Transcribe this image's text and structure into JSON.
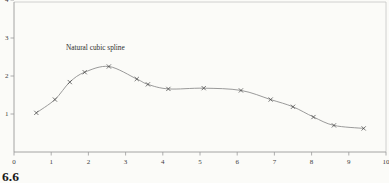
{
  "figure": {
    "number": "6.6"
  },
  "chart_data": {
    "type": "line",
    "title": "",
    "xlabel": "",
    "ylabel": "",
    "annotation": {
      "text": "Natural cubic spline",
      "x": 1.4,
      "y": 2.78
    },
    "x": [
      0.6,
      1.1,
      1.5,
      1.9,
      2.55,
      3.3,
      3.6,
      4.15,
      5.1,
      6.1,
      6.9,
      7.5,
      8.05,
      8.6,
      9.4
    ],
    "y": [
      1.03,
      1.38,
      1.84,
      2.1,
      2.25,
      1.92,
      1.78,
      1.66,
      1.68,
      1.62,
      1.38,
      1.19,
      0.92,
      0.7,
      0.62
    ],
    "xticks": [
      0,
      1,
      2,
      3,
      4,
      5,
      6,
      7,
      8,
      9,
      10
    ],
    "yticks": [
      1,
      2,
      3,
      4
    ],
    "xlim": [
      0,
      10
    ],
    "ylim": [
      0,
      4
    ],
    "marker": "x",
    "grid": false,
    "legend": "none",
    "colors": {
      "curve": "#8e8e8e",
      "marker": "#474747",
      "axis": "#9a9a9a",
      "frame": "#c6c6c4",
      "text": "#3d3d3d",
      "background": "#fbfbf8"
    }
  }
}
